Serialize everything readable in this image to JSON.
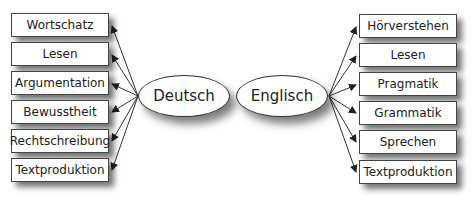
{
  "diagram": {
    "center_nodes": [
      {
        "label": "Deutsch"
      },
      {
        "label": "Englisch"
      }
    ],
    "deutsch_targets": [
      {
        "label": "Wortschatz"
      },
      {
        "label": "Lesen"
      },
      {
        "label": "Argumentation"
      },
      {
        "label": "Bewusstheit"
      },
      {
        "label": "Rechtschreibung"
      },
      {
        "label": "Textproduktion"
      }
    ],
    "englisch_targets": [
      {
        "label": "Hörverstehen"
      },
      {
        "label": "Lesen"
      },
      {
        "label": "Pragmatik"
      },
      {
        "label": "Grammatik"
      },
      {
        "label": "Sprechen"
      },
      {
        "label": "Textproduktion"
      }
    ],
    "colors": {
      "stroke": "#333333",
      "fill": "#ffffff",
      "shadow": "#555555"
    }
  }
}
